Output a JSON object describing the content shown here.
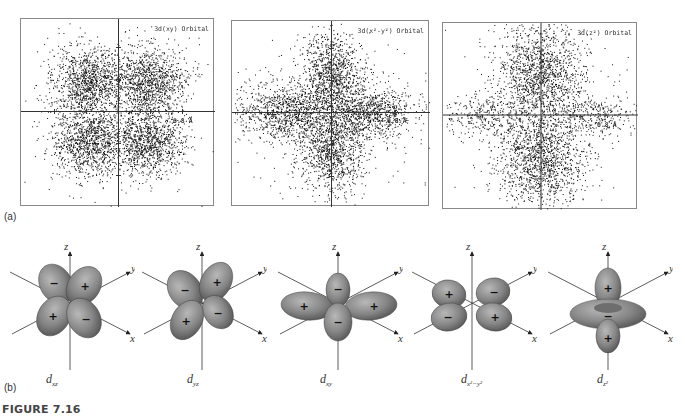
{
  "figure": {
    "caption": "FIGURE 7.16",
    "part_a_label": "(a)",
    "part_b_label": "(b)"
  },
  "part_a": {
    "panels": [
      {
        "title": "3d(xy) Orbital",
        "scale_label": "0.8 Å",
        "lobes": "diagonal"
      },
      {
        "title": "3d(x²-y²) Orbital",
        "scale_label": "0.8 Å",
        "lobes": "axial"
      },
      {
        "title": "3d(z²) Orbital",
        "scale_label": "0.8 Å",
        "lobes": "z2"
      }
    ]
  },
  "part_b": {
    "axis_labels": {
      "z": "z",
      "y": "y",
      "x": "x"
    },
    "orbitals": [
      {
        "name": "d",
        "sub": "xz",
        "signs": [
          "−",
          "+",
          "+",
          "−"
        ]
      },
      {
        "name": "d",
        "sub": "yz",
        "signs": [
          "−",
          "+",
          "+",
          "−"
        ]
      },
      {
        "name": "d",
        "sub": "xy",
        "signs": [
          "−",
          "+",
          "+",
          "−"
        ]
      },
      {
        "name": "d",
        "sub": "x²−y²",
        "signs": [
          "+",
          "−",
          "−",
          "+"
        ]
      },
      {
        "name": "d",
        "sub": "z²",
        "signs": [
          "+",
          "−",
          "+"
        ]
      }
    ]
  },
  "colors": {
    "lobe_fill": "#8a8a8a",
    "lobe_dark": "#555555",
    "axis": "#333333",
    "frame": "#888888"
  }
}
